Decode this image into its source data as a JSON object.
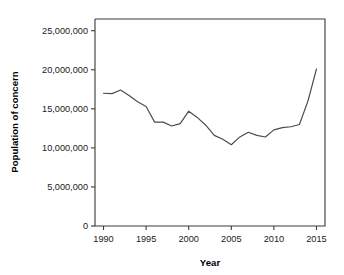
{
  "chart_data": {
    "type": "line",
    "title": "",
    "xlabel": "Year",
    "ylabel": "Population of concern",
    "xlim": [
      1989,
      2016
    ],
    "ylim": [
      0,
      26500000
    ],
    "grid": false,
    "legend": "none",
    "xticks": [
      1990,
      1995,
      2000,
      2005,
      2010,
      2015
    ],
    "xtick_labels": [
      "1990",
      "1995",
      "2000",
      "2005",
      "2010",
      "2015"
    ],
    "yticks": [
      0,
      5000000,
      10000000,
      15000000,
      20000000,
      25000000
    ],
    "ytick_labels": [
      "0",
      "5,000,000",
      "10,000,000",
      "15,000,000",
      "20,000,000",
      "25,000,000"
    ],
    "x": [
      1990,
      1991,
      1992,
      1993,
      1994,
      1995,
      1996,
      1997,
      1998,
      1999,
      2000,
      2001,
      2002,
      2003,
      2004,
      2005,
      2006,
      2007,
      2008,
      2009,
      2010,
      2011,
      2012,
      2013,
      2014,
      2015
    ],
    "values": [
      17000000,
      16950000,
      17400000,
      16700000,
      15900000,
      15300000,
      13300000,
      13300000,
      12800000,
      13100000,
      14700000,
      13900000,
      12900000,
      11600000,
      11100000,
      10400000,
      11400000,
      12000000,
      11600000,
      11400000,
      12300000,
      12600000,
      12700000,
      13000000,
      16000000,
      20100000
    ],
    "series": [
      {
        "name": "Population of concern",
        "color": "#4a4a4a",
        "values": [
          17000000,
          16950000,
          17400000,
          16700000,
          15900000,
          15300000,
          13300000,
          13300000,
          12800000,
          13100000,
          14700000,
          13900000,
          12900000,
          11600000,
          11100000,
          10400000,
          11400000,
          12000000,
          11600000,
          11400000,
          12300000,
          12600000,
          12700000,
          13000000,
          16000000,
          20100000
        ]
      }
    ]
  },
  "axis": {
    "x_title": "Year",
    "y_title": "Population of concern"
  }
}
